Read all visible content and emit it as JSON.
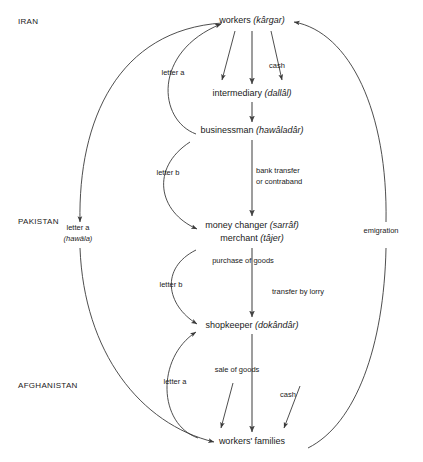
{
  "diagram": {
    "regions": [
      {
        "name": "region-iran",
        "label": "IRAN",
        "x": 18,
        "y": 24
      },
      {
        "name": "region-pakistan",
        "label": "PAKISTAN",
        "x": 18,
        "y": 224
      },
      {
        "name": "region-afghanistan",
        "label": "AFGHANISTAN",
        "x": 18,
        "y": 388
      }
    ],
    "nodes": [
      {
        "name": "node-workers",
        "english": "workers",
        "term": "(kârgar)",
        "x": 252,
        "y": 23
      },
      {
        "name": "node-intermediary",
        "english": "intermediary",
        "term": "(dallâl)",
        "x": 252,
        "y": 96
      },
      {
        "name": "node-businessman",
        "english": "businessman",
        "term": "(hawâladâr)",
        "x": 252,
        "y": 133
      },
      {
        "name": "node-money-changer",
        "english": "money changer",
        "term": "(sarrâf)",
        "x": 252,
        "y": 228
      },
      {
        "name": "node-merchant",
        "english": "merchant",
        "term": "(tâjer)",
        "x": 252,
        "y": 241
      },
      {
        "name": "node-shopkeeper",
        "english": "shopkeeper",
        "term": "(dokândâr)",
        "x": 252,
        "y": 328
      },
      {
        "name": "node-workers-families",
        "english": "workers' families",
        "term": "",
        "x": 252,
        "y": 444
      }
    ],
    "edge_labels": [
      {
        "name": "edge-label-letter-a-top",
        "text": "letter a",
        "x": 173,
        "y": 75
      },
      {
        "name": "edge-label-cash-top",
        "text": "cash",
        "x": 277,
        "y": 68
      },
      {
        "name": "edge-label-letter-b-upper",
        "text": "letter b",
        "x": 168,
        "y": 175
      },
      {
        "name": "edge-label-bank-transfer",
        "text": "bank transfer",
        "x": 256,
        "y": 173
      },
      {
        "name": "edge-label-or-contraband",
        "text": "or contraband",
        "x": 256,
        "y": 184
      },
      {
        "name": "edge-label-letter-a-hawala",
        "text": "letter a",
        "x": 78,
        "y": 230
      },
      {
        "name": "edge-label-hawala-term",
        "text": "(hawâla)",
        "x": 78,
        "y": 241
      },
      {
        "name": "edge-label-emigration",
        "text": "emigration",
        "x": 381,
        "y": 233
      },
      {
        "name": "edge-label-purchase-of-goods",
        "text": "purchase of goods",
        "x": 243,
        "y": 263
      },
      {
        "name": "edge-label-letter-b-lower",
        "text": "letter b",
        "x": 171,
        "y": 287
      },
      {
        "name": "edge-label-transfer-by-lorry",
        "text": "transfer by lorry",
        "x": 272,
        "y": 294
      },
      {
        "name": "edge-label-sale-of-goods",
        "text": "sale of goods",
        "x": 237,
        "y": 372
      },
      {
        "name": "edge-label-letter-a-bottom",
        "text": "letter a",
        "x": 175,
        "y": 384
      },
      {
        "name": "edge-label-cash-bottom",
        "text": "cash",
        "x": 288,
        "y": 397
      }
    ],
    "colors": {
      "background": "#ffffff",
      "text": "#1a1a1a",
      "flow_line": "#555555",
      "curve_line": "#3a3a3a"
    }
  }
}
